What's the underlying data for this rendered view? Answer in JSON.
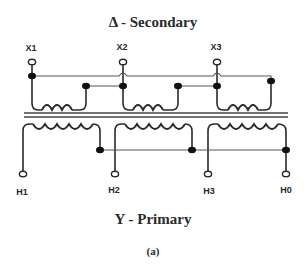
{
  "diagram": {
    "secondary_title": "Δ - Secondary",
    "primary_title": "Y - Primary",
    "caption": "(a)",
    "secondary_terminals": [
      {
        "label": "X1"
      },
      {
        "label": "X2"
      },
      {
        "label": "X3"
      }
    ],
    "primary_terminals": [
      {
        "label": "H1"
      },
      {
        "label": "H2"
      },
      {
        "label": "H3"
      },
      {
        "label": "H0"
      }
    ],
    "colors": {
      "line": "#2a2a2a",
      "background": "#ffffff"
    }
  }
}
